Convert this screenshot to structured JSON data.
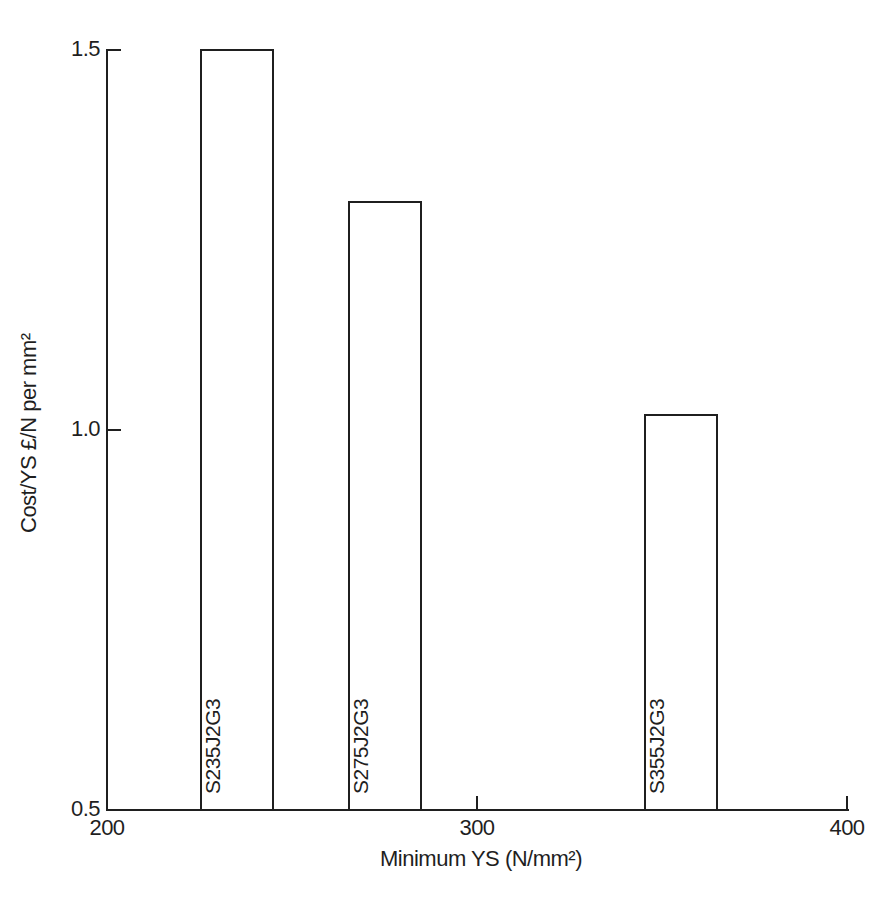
{
  "figure": {
    "background": "#ffffff",
    "ink_color": "#1f1f1f"
  },
  "chart_data": {
    "type": "bar",
    "title": "",
    "xlabel": "Minimum YS (N/mm²)",
    "ylabel": "Cost/YS £/N per mm²",
    "xlim": [
      200,
      400
    ],
    "ylim": [
      0.5,
      1.5
    ],
    "grid": false,
    "legend": null,
    "x_ticks": [
      {
        "value": 200,
        "label": "200"
      },
      {
        "value": 300,
        "label": "300"
      },
      {
        "value": 400,
        "label": "400"
      }
    ],
    "y_ticks": [
      {
        "value": 1.5,
        "label": "1.5"
      },
      {
        "value": 1.0,
        "label": "1.0"
      },
      {
        "value": 0.5,
        "label": "0.5"
      }
    ],
    "bars": [
      {
        "label": "S235J2G3",
        "x_center": 235,
        "x_width": 20,
        "value": 1.5
      },
      {
        "label": "S275J2G3",
        "x_center": 275,
        "x_width": 20,
        "value": 1.3
      },
      {
        "label": "S355J2G3",
        "x_center": 355,
        "x_width": 20,
        "value": 1.02
      }
    ],
    "bar_style": {
      "fill": "#ffffff",
      "stroke": "#1f1f1f"
    },
    "bar_label_orientation": "vertical-bottom-to-top"
  }
}
